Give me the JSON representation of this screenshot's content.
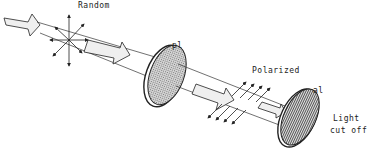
{
  "labels": {
    "random": "Random",
    "polarizer": "pl",
    "polarized": "Polarized",
    "analyzer": "al",
    "cutoff_line1": "Light",
    "cutoff_line2": "cut off"
  },
  "colors": {
    "stroke": "#222222",
    "beam_fill": "#efefef",
    "disc_fill": "#a8a8a8",
    "background": "#ffffff"
  }
}
